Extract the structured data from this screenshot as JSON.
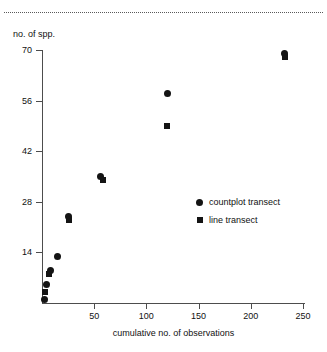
{
  "chart_data": {
    "type": "scatter",
    "title": "",
    "xlabel": "cumulative no. of observations",
    "ylabel": "no. of spp.",
    "xlim": [
      0,
      252
    ],
    "ylim": [
      0,
      70
    ],
    "xticks": [
      50,
      100,
      150,
      200,
      250
    ],
    "yticks": [
      14,
      28,
      42,
      56,
      70
    ],
    "grid": false,
    "legend_position": "center-right",
    "series": [
      {
        "name": "countplot transect",
        "marker": "circle",
        "points": [
          {
            "x": 2,
            "y": 1
          },
          {
            "x": 4,
            "y": 5
          },
          {
            "x": 8,
            "y": 9
          },
          {
            "x": 15,
            "y": 13
          },
          {
            "x": 25,
            "y": 24
          },
          {
            "x": 56,
            "y": 35
          },
          {
            "x": 120,
            "y": 58
          },
          {
            "x": 232,
            "y": 69
          }
        ]
      },
      {
        "name": "line transect",
        "marker": "square",
        "points": [
          {
            "x": 3,
            "y": 3
          },
          {
            "x": 7,
            "y": 8
          },
          {
            "x": 26,
            "y": 23
          },
          {
            "x": 58,
            "y": 34
          },
          {
            "x": 120,
            "y": 49
          },
          {
            "x": 233,
            "y": 68
          }
        ]
      }
    ]
  },
  "axes": {
    "y_title": "no. of spp.",
    "x_title": "cumulative no. of observations",
    "y_tick_labels": [
      "70",
      "56",
      "42",
      "28",
      "14"
    ],
    "x_tick_labels": [
      "50",
      "100",
      "150",
      "200",
      "250"
    ]
  },
  "legend": {
    "entries": [
      {
        "label": "countplot transect",
        "marker": "circle"
      },
      {
        "label": "line transect",
        "marker": "square"
      }
    ]
  },
  "decorations": {
    "top_rule": "dotted-horizontal-rule"
  }
}
